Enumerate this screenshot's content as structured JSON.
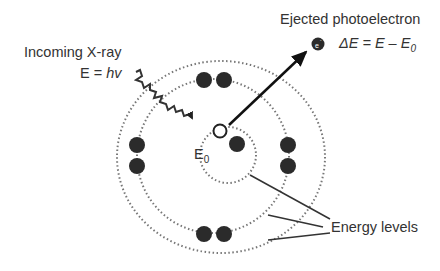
{
  "labels": {
    "incoming": "Incoming X-ray",
    "incoming_energy_prefix": "E = ",
    "incoming_energy_var": "hv",
    "ejected": "Ejected photoelectron",
    "ejected_energy": "ΔE = E – E",
    "ejected_energy_sub": "0",
    "core_level": "E",
    "core_level_sub": "0",
    "energy_levels": "Energy levels",
    "electron_symbol": "e-"
  },
  "colors": {
    "line": "#222222",
    "electron": "#2b2b2b",
    "dots": "#777777",
    "text": "#333333"
  }
}
